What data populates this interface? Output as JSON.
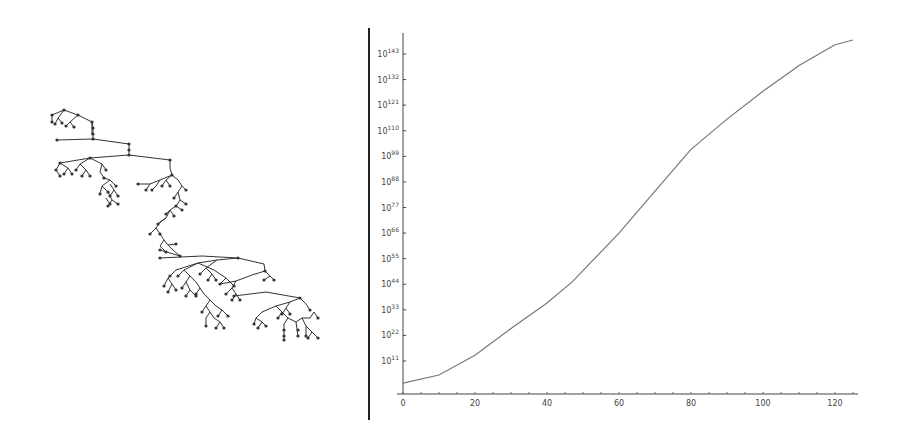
{
  "left_panel": {
    "description": "Random binary-like rooted tree drawing with small dot nodes",
    "node_color": "#333333",
    "edge_color": "#333333"
  },
  "chart_data": {
    "type": "line",
    "title": "",
    "xlabel": "",
    "ylabel": "",
    "y_scale": "log",
    "xlim": [
      0,
      125
    ],
    "ylim_exponent": [
      0,
      150
    ],
    "x_ticks": [
      0,
      20,
      40,
      60,
      80,
      100,
      120
    ],
    "x_tick_labels": [
      "0",
      "20",
      "40",
      "60",
      "80",
      "100",
      "120"
    ],
    "y_ticks_exponent": [
      11,
      22,
      33,
      44,
      55,
      66,
      77,
      88,
      99,
      110,
      121,
      132,
      143
    ],
    "y_tick_labels": [
      "10^11",
      "10^22",
      "10^33",
      "10^44",
      "10^55",
      "10^66",
      "10^77",
      "10^88",
      "10^99",
      "10^110",
      "10^121",
      "10^132",
      "10^143"
    ],
    "grid": false,
    "legend": null,
    "series": [
      {
        "name": "count",
        "color": "#777777",
        "x": [
          0,
          10,
          20,
          30,
          40,
          47,
          60,
          70,
          80,
          90,
          100,
          110,
          120,
          125
        ],
        "log10_y": [
          1.5,
          5,
          13.5,
          25,
          36,
          45,
          66,
          84,
          102,
          115,
          127,
          138,
          147,
          149
        ]
      }
    ]
  }
}
